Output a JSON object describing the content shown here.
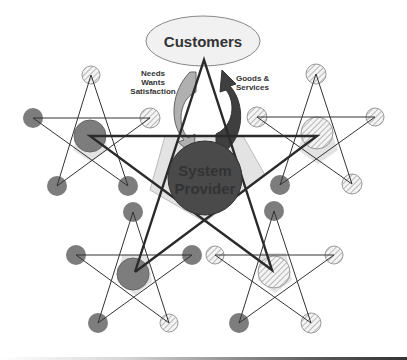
{
  "diagram": {
    "center": {
      "label_line1": "System",
      "label_line2": "Provider"
    },
    "top": {
      "label": "Customers"
    },
    "left_arrow": {
      "line1": "Needs",
      "line2": "Wants",
      "line3": "Satisfaction"
    },
    "right_arrow": {
      "line1": "Goods &",
      "line2": "Services"
    }
  },
  "colors": {
    "dark_node": "#4a4a4a",
    "mid_node": "#7d7d7d",
    "light_fill": "#e3e3e3",
    "customers_fill": "#f1f1f1",
    "arrow_left": "#b0b0b0",
    "arrow_right": "#3f3f3f",
    "line": "#2a2a2a"
  }
}
